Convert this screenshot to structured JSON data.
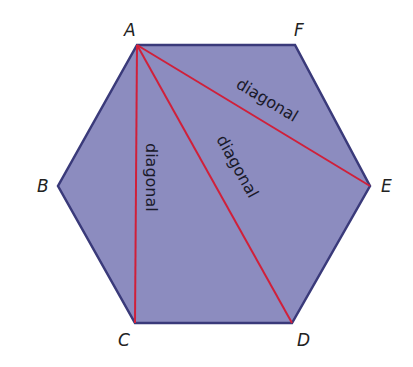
{
  "diagram": {
    "shape": "regular hexagon",
    "fill_color": "#8c8cbf",
    "stroke_color": "#3a3a7a",
    "diagonal_color": "#d0203a",
    "vertices": [
      {
        "name": "A",
        "x": 137,
        "y": 45
      },
      {
        "name": "F",
        "x": 295,
        "y": 45
      },
      {
        "name": "E",
        "x": 370,
        "y": 186
      },
      {
        "name": "D",
        "x": 292,
        "y": 323
      },
      {
        "name": "C",
        "x": 135,
        "y": 323
      },
      {
        "name": "B",
        "x": 58,
        "y": 186
      }
    ],
    "labels": {
      "A": "A",
      "B": "B",
      "C": "C",
      "D": "D",
      "E": "E",
      "F": "F"
    },
    "diagonals": [
      {
        "from": "A",
        "to": "C",
        "label": "diagonal"
      },
      {
        "from": "A",
        "to": "D",
        "label": "diagonal"
      },
      {
        "from": "A",
        "to": "E",
        "label": "diagonal"
      }
    ]
  }
}
